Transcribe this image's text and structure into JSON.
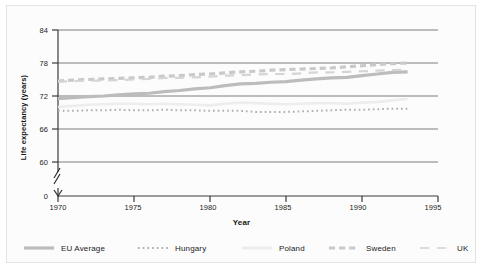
{
  "chart_data": {
    "type": "line",
    "title": "",
    "xlabel": "Year",
    "ylabel": "Life expectancy (years)",
    "xlim": [
      1970,
      1995
    ],
    "ylim": [
      60,
      84
    ],
    "y_axis_break": true,
    "y_break_labels": [
      "0",
      "60"
    ],
    "grid": true,
    "grid_axis": "y",
    "legend_position": "bottom",
    "xticks": [
      1970,
      1975,
      1980,
      1985,
      1990,
      1995
    ],
    "xtick_labels": [
      "1970",
      "1975",
      "1980",
      "1985",
      "1990",
      "1995"
    ],
    "yticks": [
      0,
      60,
      66,
      72,
      78,
      84
    ],
    "ytick_labels": [
      "0",
      "60",
      "66",
      "72",
      "78",
      "84"
    ],
    "x": [
      1970,
      1971,
      1972,
      1973,
      1974,
      1975,
      1976,
      1977,
      1978,
      1979,
      1980,
      1981,
      1982,
      1983,
      1984,
      1985,
      1986,
      1987,
      1988,
      1989,
      1990,
      1991,
      1992,
      1993
    ],
    "series": [
      {
        "name": "EU Average",
        "style": "solid",
        "color": "#bcbcbc",
        "width": 3.2,
        "values": [
          71.5,
          71.7,
          71.9,
          72.0,
          72.2,
          72.4,
          72.5,
          72.8,
          73.0,
          73.3,
          73.5,
          73.9,
          74.2,
          74.3,
          74.5,
          74.6,
          74.9,
          75.1,
          75.3,
          75.4,
          75.7,
          76.0,
          76.3,
          76.4
        ]
      },
      {
        "name": "Hungary",
        "style": "dotted",
        "color": "#b0b0b0",
        "width": 2.0,
        "values": [
          69.3,
          69.3,
          69.4,
          69.4,
          69.5,
          69.4,
          69.4,
          69.5,
          69.4,
          69.4,
          69.3,
          69.3,
          69.3,
          69.1,
          69.1,
          69.1,
          69.2,
          69.3,
          69.4,
          69.5,
          69.5,
          69.6,
          69.7,
          69.7
        ]
      },
      {
        "name": "Poland",
        "style": "solid",
        "color": "#ededed",
        "width": 2.6,
        "values": [
          70.0,
          70.2,
          70.4,
          70.5,
          70.6,
          70.6,
          70.5,
          70.6,
          70.5,
          70.4,
          70.3,
          70.6,
          70.8,
          70.7,
          70.6,
          70.5,
          70.6,
          70.7,
          70.7,
          70.6,
          70.8,
          70.9,
          71.2,
          71.5
        ]
      },
      {
        "name": "Sweden",
        "style": "dashed",
        "color": "#c9c9c9",
        "width": 3.2,
        "values": [
          74.7,
          74.9,
          75.0,
          75.1,
          75.2,
          75.3,
          75.4,
          75.6,
          75.7,
          75.9,
          76.0,
          76.2,
          76.4,
          76.5,
          76.7,
          76.8,
          76.9,
          77.0,
          77.1,
          77.3,
          77.5,
          77.7,
          77.9,
          78.0
        ]
      },
      {
        "name": "UK",
        "style": "long-dash",
        "color": "#d5d5d5",
        "width": 2.2,
        "values": [
          74.6,
          74.7,
          74.8,
          74.8,
          74.9,
          75.0,
          75.1,
          75.3,
          75.3,
          75.4,
          75.5,
          75.7,
          75.8,
          75.9,
          76.0,
          76.0,
          76.1,
          76.3,
          76.3,
          76.4,
          76.5,
          76.6,
          76.7,
          76.8
        ]
      }
    ]
  },
  "axes": {
    "ylabel": "Life expectancy (years)",
    "xlabel": "Year",
    "ytick_labels": [
      "84",
      "78",
      "72",
      "66",
      "60",
      "0"
    ],
    "xtick_labels": [
      "1970",
      "1975",
      "1980",
      "1985",
      "1990",
      "1995"
    ]
  },
  "legend": {
    "items": [
      {
        "label": "EU Average",
        "style": "solid",
        "color": "#bcbcbc"
      },
      {
        "label": "Hungary",
        "style": "dotted",
        "color": "#b0b0b0"
      },
      {
        "label": "Poland",
        "style": "solid",
        "color": "#ececec"
      },
      {
        "label": "Sweden",
        "style": "dashed",
        "color": "#c9c9c9"
      },
      {
        "label": "UK",
        "style": "long-dash",
        "color": "#dcdcdc"
      }
    ]
  },
  "colors": {
    "axis": "#3a3a3a",
    "grid": "#6f6f6f",
    "background": "#fcfcfc",
    "frame": "#e3e3e3",
    "text": "#1b1b1b"
  }
}
